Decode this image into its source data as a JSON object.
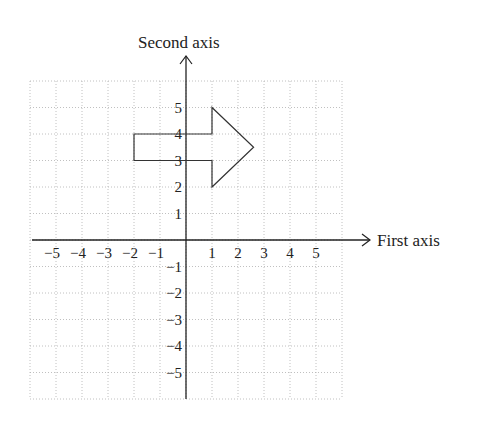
{
  "diagram": {
    "title": "",
    "x_axis_label": "First axis",
    "y_axis_label": "Second axis",
    "x_tick_labels": [
      "−5",
      "−4",
      "−3",
      "−2",
      "−1",
      "1",
      "2",
      "3",
      "4",
      "5"
    ],
    "y_tick_labels": [
      "5",
      "4",
      "3",
      "2",
      "1",
      "−1",
      "−2",
      "−3",
      "−4",
      "−5"
    ],
    "grid_range": {
      "x": [
        -6,
        6
      ],
      "y": [
        -6,
        6
      ]
    },
    "grid_style": "dotted",
    "shape": {
      "name": "right-pointing arrow polygon",
      "vertices": [
        [
          -2,
          3
        ],
        [
          -2,
          4
        ],
        [
          1,
          4
        ],
        [
          1,
          5
        ],
        [
          2.6,
          3.5
        ],
        [
          1,
          2
        ],
        [
          1,
          3
        ]
      ]
    },
    "colors": {
      "axis": "#222222",
      "grid": "#b0b0b0",
      "shape": "#333333"
    }
  }
}
